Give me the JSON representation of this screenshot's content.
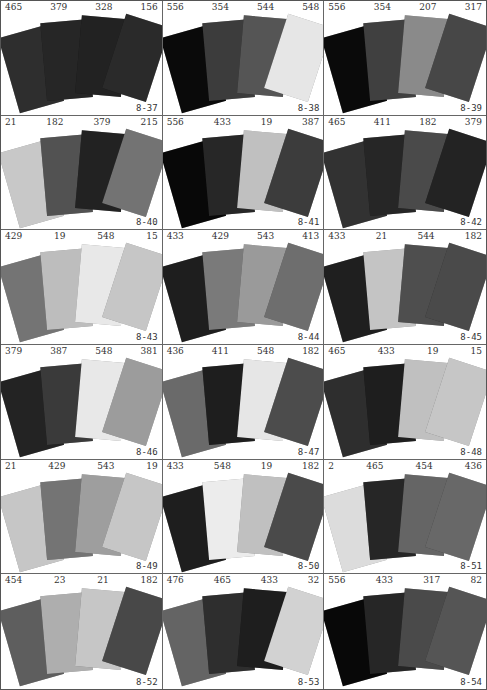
{
  "panels": [
    {
      "id": "8-37",
      "codes": [
        "465",
        "379",
        "328",
        "156"
      ],
      "colors": [
        "#2e2e2e",
        "#262626",
        "#222222",
        "#2a2a2a"
      ]
    },
    {
      "id": "8-38",
      "codes": [
        "556",
        "354",
        "544",
        "548"
      ],
      "colors": [
        "#0a0a0a",
        "#3c3c3c",
        "#555555",
        "#e6e6e6"
      ]
    },
    {
      "id": "8-39",
      "codes": [
        "556",
        "354",
        "207",
        "317"
      ],
      "colors": [
        "#0a0a0a",
        "#404040",
        "#8a8a8a",
        "#474747"
      ]
    },
    {
      "id": "8-40",
      "codes": [
        "21",
        "182",
        "379",
        "215"
      ],
      "colors": [
        "#c8c8c8",
        "#525252",
        "#222222",
        "#737373"
      ]
    },
    {
      "id": "8-41",
      "codes": [
        "556",
        "433",
        "19",
        "387"
      ],
      "colors": [
        "#080808",
        "#272727",
        "#c0c0c0",
        "#3c3c3c"
      ]
    },
    {
      "id": "8-42",
      "codes": [
        "465",
        "411",
        "182",
        "379"
      ],
      "colors": [
        "#323232",
        "#262626",
        "#4a4a4a",
        "#232323"
      ]
    },
    {
      "id": "8-43",
      "codes": [
        "429",
        "19",
        "548",
        "15"
      ],
      "colors": [
        "#747474",
        "#bdbdbd",
        "#e8e8e8",
        "#c6c6c6"
      ]
    },
    {
      "id": "8-44",
      "codes": [
        "433",
        "429",
        "543",
        "413"
      ],
      "colors": [
        "#1e1e1e",
        "#7a7a7a",
        "#9a9a9a",
        "#6e6e6e"
      ]
    },
    {
      "id": "8-45",
      "codes": [
        "433",
        "21",
        "544",
        "182"
      ],
      "colors": [
        "#1f1f1f",
        "#c4c4c4",
        "#4e4e4e",
        "#4a4a4a"
      ]
    },
    {
      "id": "8-46",
      "codes": [
        "379",
        "387",
        "548",
        "381"
      ],
      "colors": [
        "#232323",
        "#3a3a3a",
        "#e8e8e8",
        "#9c9c9c"
      ]
    },
    {
      "id": "8-47",
      "codes": [
        "436",
        "411",
        "548",
        "182"
      ],
      "colors": [
        "#6a6a6a",
        "#1e1e1e",
        "#e6e6e6",
        "#4c4c4c"
      ]
    },
    {
      "id": "8-48",
      "codes": [
        "465",
        "433",
        "19",
        "15"
      ],
      "colors": [
        "#2e2e2e",
        "#1e1e1e",
        "#c0c0c0",
        "#c6c6c6"
      ]
    },
    {
      "id": "8-49",
      "codes": [
        "21",
        "429",
        "543",
        "19"
      ],
      "colors": [
        "#c6c6c6",
        "#747474",
        "#9e9e9e",
        "#c6c6c6"
      ]
    },
    {
      "id": "8-50",
      "codes": [
        "433",
        "548",
        "19",
        "182"
      ],
      "colors": [
        "#1e1e1e",
        "#ececec",
        "#c0c0c0",
        "#4a4a4a"
      ]
    },
    {
      "id": "8-51",
      "codes": [
        "2",
        "465",
        "454",
        "436"
      ],
      "colors": [
        "#dcdcdc",
        "#262626",
        "#656565",
        "#686868"
      ]
    },
    {
      "id": "8-52",
      "codes": [
        "454",
        "23",
        "21",
        "182"
      ],
      "colors": [
        "#5e5e5e",
        "#aeaeae",
        "#c6c6c6",
        "#484848"
      ]
    },
    {
      "id": "8-53",
      "codes": [
        "476",
        "465",
        "433",
        "32"
      ],
      "colors": [
        "#646464",
        "#2e2e2e",
        "#1e1e1e",
        "#d2d2d2"
      ]
    },
    {
      "id": "8-54",
      "codes": [
        "556",
        "433",
        "317",
        "82"
      ],
      "colors": [
        "#080808",
        "#262626",
        "#4a4a4a",
        "#555555"
      ]
    }
  ]
}
